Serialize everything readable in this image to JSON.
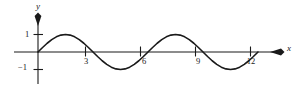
{
  "figure": {
    "kind": "cartesian-plot",
    "ink_color": "#1a1a1a",
    "background_color": "#ffffff",
    "axis_labels": {
      "x": "x",
      "y": "y"
    },
    "y_tick_labels": [
      {
        "value": 1,
        "text": "1"
      },
      {
        "value": -1,
        "text": "−1"
      }
    ],
    "x_tick_labels": [
      {
        "value": 3,
        "text": "3"
      },
      {
        "value": 6,
        "text": "6"
      },
      {
        "value": 9,
        "text": "9"
      },
      {
        "value": 12,
        "text": "12"
      }
    ]
  },
  "chart_data": {
    "type": "line",
    "title": "",
    "subtitle": "",
    "xlabel": "x",
    "ylabel": "y",
    "xlim": [
      -0.6,
      13.6
    ],
    "ylim": [
      -1.9,
      2.3
    ],
    "grid": false,
    "legend": null,
    "annotations": [],
    "x_ticks": [
      3,
      6,
      9,
      12
    ],
    "x_tick_labels": [
      "3",
      "6",
      "9",
      "12"
    ],
    "y_ticks": [
      -1,
      1
    ],
    "y_tick_labels": [
      "−1",
      "1"
    ],
    "axis_arrows": {
      "x_positive": true,
      "y_positive": true
    },
    "series": [
      {
        "name": "y = sin(2πx/6)",
        "amplitude": 1,
        "period": 6,
        "phase": 0,
        "x": [
          0.0,
          0.25,
          0.5,
          0.75,
          1.0,
          1.25,
          1.5,
          1.75,
          2.0,
          2.25,
          2.5,
          2.75,
          3.0,
          3.25,
          3.5,
          3.75,
          4.0,
          4.25,
          4.5,
          4.75,
          5.0,
          5.25,
          5.5,
          5.75,
          6.0,
          6.25,
          6.5,
          6.75,
          7.0,
          7.25,
          7.5,
          7.75,
          8.0,
          8.25,
          8.5,
          8.75,
          9.0,
          9.25,
          9.5,
          9.75,
          10.0,
          10.25,
          10.5,
          10.75,
          11.0,
          11.25,
          11.5,
          11.75,
          12.0
        ],
        "values": [
          0.0,
          0.259,
          0.5,
          0.707,
          0.866,
          0.966,
          1.0,
          0.966,
          0.866,
          0.707,
          0.5,
          0.259,
          0.0,
          -0.259,
          -0.5,
          -0.707,
          -0.866,
          -0.966,
          -1.0,
          -0.966,
          -0.866,
          -0.707,
          -0.5,
          -0.259,
          0.0,
          0.259,
          0.5,
          0.707,
          0.866,
          0.966,
          1.0,
          0.966,
          0.866,
          0.707,
          0.5,
          0.259,
          0.0,
          -0.259,
          -0.5,
          -0.707,
          -0.866,
          -0.966,
          -1.0,
          -0.966,
          -0.866,
          -0.707,
          -0.5,
          -0.259,
          0.0
        ],
        "zero_crossings": [
          0,
          3,
          6,
          9,
          12
        ],
        "maxima": [
          {
            "x": 1.5,
            "y": 1
          },
          {
            "x": 7.5,
            "y": 1
          }
        ],
        "minima": [
          {
            "x": 4.5,
            "y": -1
          },
          {
            "x": 10.5,
            "y": -1
          }
        ]
      }
    ]
  }
}
